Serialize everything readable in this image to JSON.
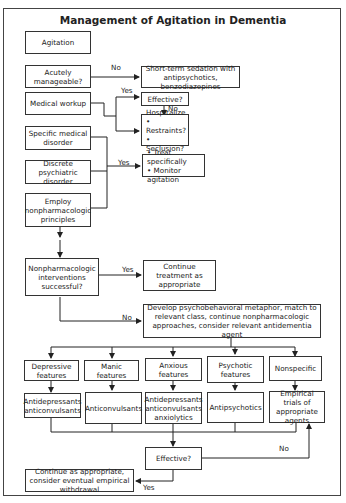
{
  "title": "Management of Agitation in Dementia",
  "nodes": {
    "agitation": "Agitation",
    "acutely_manageable": "Acutely manageable?",
    "short_term_sedation": "Short-term sedation with antipsychotics, benzodiazepines",
    "medical_workup": "Medical workup",
    "effective_1": "Effective?",
    "hospitalize": {
      "title": "Hospitalize",
      "items": [
        "Restraints?",
        "Seclusion?"
      ]
    },
    "specific_medical_disorder": "Specific medical disorder",
    "discrete_psychiatric_disorder": "Discrete psychiatric disorder",
    "treat_box": {
      "items": [
        "Treat specifically",
        "Monitor agitation"
      ]
    },
    "employ_nonpharm": "Employ nonpharmacologic principles",
    "nonpharm_successful": "Nonpharmacologic interventions successful?",
    "continue_treatment": "Continue treatment as appropriate",
    "develop_metaphor": "Develop psychobehavioral metaphor, match to relevant class, continue nonpharmacologic approaches, consider relevant antidementia agent",
    "features": [
      {
        "label": "Depressive features",
        "treatment": "Antidepressants anticonvulsants"
      },
      {
        "label": "Manic features",
        "treatment": "Anticonvulsants"
      },
      {
        "label": "Anxious features",
        "treatment": "Antidepressants anticonvulsants anxiolytics"
      },
      {
        "label": "Psychotic features",
        "treatment": "Antipsychotics"
      },
      {
        "label": "Nonspecific",
        "treatment": "Empirical trials of appropriate agents"
      }
    ],
    "effective_2": "Effective?",
    "continue_withdrawal": "Continue as appropriate, consider eventual empirical withdrawal"
  },
  "edge_labels": {
    "no_sedation": "No",
    "yes_effective": "Yes",
    "no_hospitalize": "No",
    "yes_treat": "Yes",
    "yes_continue": "Yes",
    "no_develop": "No",
    "no_retry": "No",
    "yes_withdrawal": "Yes"
  },
  "bullet": "•"
}
